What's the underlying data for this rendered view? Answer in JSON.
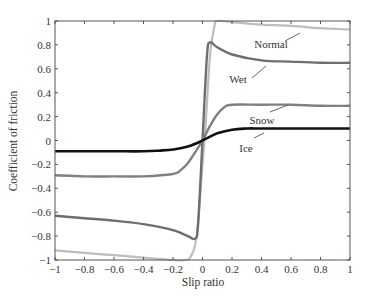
{
  "chart_data": {
    "type": "line",
    "title": "",
    "xlabel": "Slip ratio",
    "ylabel": "Coefficient of friction",
    "xlim": [
      -1,
      1
    ],
    "ylim": [
      -1,
      1
    ],
    "xticks": [
      "-1",
      "-0.8",
      "-0.6",
      "-0.4",
      "-0.2",
      "0",
      "0.2",
      "0.4",
      "0.6",
      "0.8",
      "1"
    ],
    "yticks": [
      "1",
      "0.8",
      "0.6",
      "0.4",
      "0.2",
      "0",
      "-0.2",
      "-0.4",
      "-0.6",
      "-0.8",
      "-1"
    ],
    "grid": false,
    "legend": "inline labels",
    "series": [
      {
        "name": "Normal",
        "color": "#bdbdbd",
        "x": [
          -1,
          -0.8,
          -0.6,
          -0.4,
          -0.3,
          -0.2,
          -0.12,
          -0.08,
          -0.04,
          0,
          0.02,
          0.05,
          0.08,
          0.1,
          0.2,
          0.4,
          0.6,
          0.8,
          1
        ],
        "y": [
          -0.92,
          -0.94,
          -0.96,
          -0.98,
          -0.99,
          -1.0,
          -1.0,
          -0.97,
          -0.8,
          -0.2,
          0.1,
          0.7,
          0.95,
          1.0,
          0.99,
          0.97,
          0.96,
          0.94,
          0.93
        ]
      },
      {
        "name": "Wet",
        "color": "#6e6e6e",
        "x": [
          -1,
          -0.8,
          -0.6,
          -0.4,
          -0.2,
          -0.1,
          -0.05,
          -0.03,
          0,
          0.03,
          0.05,
          0.1,
          0.2,
          0.4,
          0.6,
          0.8,
          1
        ],
        "y": [
          -0.63,
          -0.65,
          -0.67,
          -0.7,
          -0.75,
          -0.8,
          -0.82,
          -0.7,
          0,
          0.7,
          0.82,
          0.78,
          0.72,
          0.67,
          0.66,
          0.65,
          0.65
        ]
      },
      {
        "name": "Snow",
        "color": "#808080",
        "x": [
          -1,
          -0.8,
          -0.6,
          -0.4,
          -0.2,
          -0.15,
          -0.1,
          -0.05,
          0,
          0.05,
          0.1,
          0.15,
          0.2,
          0.4,
          0.6,
          0.8,
          1
        ],
        "y": [
          -0.29,
          -0.3,
          -0.3,
          -0.3,
          -0.28,
          -0.25,
          -0.19,
          -0.1,
          0,
          0.12,
          0.22,
          0.28,
          0.3,
          0.3,
          0.3,
          0.29,
          0.29
        ]
      },
      {
        "name": "Ice",
        "color": "#111111",
        "x": [
          -1,
          -0.8,
          -0.6,
          -0.4,
          -0.3,
          -0.2,
          -0.1,
          0,
          0.1,
          0.2,
          0.3,
          0.4,
          0.6,
          0.8,
          1
        ],
        "y": [
          -0.09,
          -0.09,
          -0.09,
          -0.09,
          -0.085,
          -0.075,
          -0.05,
          0,
          0.06,
          0.09,
          0.1,
          0.1,
          0.1,
          0.1,
          0.1
        ]
      }
    ],
    "annotations": [
      {
        "text": "Normal",
        "x": 0.55,
        "y": 0.8
      },
      {
        "text": "Wet",
        "x": 0.2,
        "y": 0.53
      },
      {
        "text": "Snow",
        "x": 0.3,
        "y": 0.2
      },
      {
        "text": "Ice",
        "x": 0.2,
        "y": -0.04
      }
    ]
  }
}
